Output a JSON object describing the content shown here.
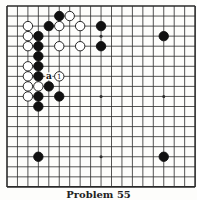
{
  "diagram": {
    "type": "go-problem",
    "size": 19,
    "caption": "Problem 55",
    "colors": {
      "line": "#2a2a2a",
      "black": "#111111",
      "white": "#ffffff",
      "background": "#fdfdfb"
    },
    "grid": {
      "x0": 7,
      "dx": 10.45,
      "y0": 6,
      "dy": 10.05
    },
    "hoshi": [
      [
        3,
        3
      ],
      [
        9,
        3
      ],
      [
        15,
        3
      ],
      [
        3,
        9
      ],
      [
        9,
        9
      ],
      [
        15,
        9
      ],
      [
        3,
        15
      ],
      [
        9,
        15
      ],
      [
        15,
        15
      ]
    ],
    "stones": [
      {
        "col": 5,
        "row": 1,
        "color": "black"
      },
      {
        "col": 6,
        "row": 1,
        "color": "white"
      },
      {
        "col": 2,
        "row": 2,
        "color": "white"
      },
      {
        "col": 4,
        "row": 2,
        "color": "black"
      },
      {
        "col": 5,
        "row": 2,
        "color": "white"
      },
      {
        "col": 7,
        "row": 2,
        "color": "white"
      },
      {
        "col": 9,
        "row": 2,
        "color": "black"
      },
      {
        "col": 2,
        "row": 3,
        "color": "white"
      },
      {
        "col": 3,
        "row": 3,
        "color": "black"
      },
      {
        "col": 2,
        "row": 4,
        "color": "white"
      },
      {
        "col": 3,
        "row": 4,
        "color": "black"
      },
      {
        "col": 5,
        "row": 4,
        "color": "white"
      },
      {
        "col": 7,
        "row": 4,
        "color": "white"
      },
      {
        "col": 9,
        "row": 4,
        "color": "black"
      },
      {
        "col": 3,
        "row": 5,
        "color": "black"
      },
      {
        "col": 2,
        "row": 6,
        "color": "white"
      },
      {
        "col": 3,
        "row": 6,
        "color": "black"
      },
      {
        "col": 2,
        "row": 7,
        "color": "white"
      },
      {
        "col": 3,
        "row": 7,
        "color": "black"
      },
      {
        "col": 5,
        "row": 7,
        "color": "white",
        "label": "1"
      },
      {
        "col": 2,
        "row": 8,
        "color": "white"
      },
      {
        "col": 3,
        "row": 8,
        "color": "white"
      },
      {
        "col": 4,
        "row": 8,
        "color": "black"
      },
      {
        "col": 2,
        "row": 9,
        "color": "white"
      },
      {
        "col": 3,
        "row": 9,
        "color": "black"
      },
      {
        "col": 5,
        "row": 9,
        "color": "black"
      },
      {
        "col": 3,
        "row": 10,
        "color": "black"
      },
      {
        "col": 15,
        "row": 3,
        "color": "black"
      },
      {
        "col": 3,
        "row": 15,
        "color": "black"
      },
      {
        "col": 15,
        "row": 15,
        "color": "black"
      }
    ],
    "markers": [
      {
        "col": 4,
        "row": 7,
        "label": "a"
      }
    ]
  }
}
